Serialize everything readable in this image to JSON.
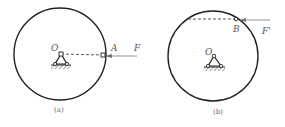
{
  "figures": [
    {
      "id": "a",
      "caption": "(a)",
      "center_label": "O",
      "point_label": "A",
      "force_label": "F"
    },
    {
      "id": "b",
      "caption": "(b)",
      "center_label": "O",
      "point_label": "B",
      "force_label": "F'"
    }
  ],
  "colors": {
    "stroke": "#222222",
    "force": "#888888",
    "text": "#555555"
  }
}
